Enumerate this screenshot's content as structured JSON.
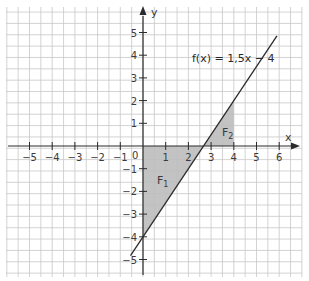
{
  "chart_data": {
    "type": "line",
    "title": "",
    "function_label": "f(x) = 1,5x − 4",
    "function": {
      "slope": 1.5,
      "intercept": -4
    },
    "line_segment": {
      "x_start": -0.55,
      "x_end": 5.9
    },
    "xlabel": "x",
    "ylabel": "y",
    "xlim": [
      -6,
      7
    ],
    "ylim": [
      -5.6,
      6.3
    ],
    "grid": true,
    "grid_step": 0.5,
    "x_ticks": [
      -5,
      -4,
      -3,
      -2,
      -1,
      1,
      2,
      3,
      4,
      5,
      6
    ],
    "x_tick_labels": [
      "−5",
      "−4",
      "−3",
      "−2",
      "−1",
      "1",
      "2",
      "3",
      "4",
      "5",
      "6"
    ],
    "y_ticks": [
      5,
      4,
      3,
      2,
      1,
      -1,
      -2,
      -3,
      -4,
      -5
    ],
    "y_tick_labels": [
      "5",
      "4",
      "3",
      "2",
      "1",
      "−1",
      "−2",
      "−3",
      "−4",
      "−5"
    ],
    "origin_label": "0",
    "shaded_areas": [
      {
        "name": "F1",
        "label_main": "F",
        "label_sub": "1",
        "vertices": [
          [
            0,
            0
          ],
          [
            0,
            -4
          ],
          [
            2.667,
            0
          ]
        ]
      },
      {
        "name": "F2",
        "label_main": "F",
        "label_sub": "2",
        "vertices": [
          [
            2.667,
            0
          ],
          [
            4,
            0
          ],
          [
            4,
            2
          ]
        ]
      }
    ],
    "colors": {
      "grid": "#c8c8c8",
      "axis": "#2b2b2b",
      "line": "#2b2b2b",
      "shade": "#bdbdbd"
    }
  }
}
